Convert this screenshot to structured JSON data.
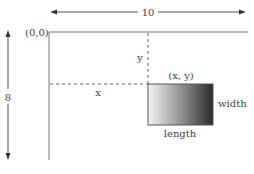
{
  "diagram": {
    "origin_label": "(0,0)",
    "horizontal_dimension_label": "10",
    "vertical_dimension_label": "8",
    "x_offset_label": "x",
    "y_offset_label": "y",
    "corner_label": "(x, y)",
    "rect_width_label": "width",
    "rect_length_label": "length",
    "colors": {
      "line": "#555555",
      "dashed": "#666666",
      "gradient_start": "#f2f2f2",
      "gradient_end": "#2e2e2e",
      "text": "#444444"
    }
  }
}
